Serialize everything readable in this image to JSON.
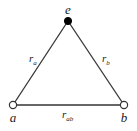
{
  "diagram": {
    "type": "triangle-graph",
    "nodes": [
      {
        "id": "e",
        "label": "e",
        "x": 68,
        "y": 21,
        "fill": "#000000",
        "style": "filled"
      },
      {
        "id": "a",
        "label": "a",
        "x": 13,
        "y": 105,
        "fill": "#ffffff",
        "style": "open"
      },
      {
        "id": "b",
        "label": "b",
        "x": 124,
        "y": 105,
        "fill": "#ffffff",
        "style": "open"
      }
    ],
    "edges": [
      {
        "from": "a",
        "to": "e",
        "label": "r",
        "subscript": "a"
      },
      {
        "from": "e",
        "to": "b",
        "label": "r",
        "subscript": "b"
      },
      {
        "from": "a",
        "to": "b",
        "label": "r",
        "subscript": "ab"
      }
    ]
  }
}
